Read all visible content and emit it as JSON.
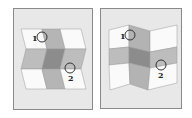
{
  "figure": {
    "panels": [
      {
        "name": "left-panel",
        "description": "zig-zag folded sheet with horizontal and vertical gray bands",
        "markers": [
          {
            "label": "1",
            "label_x": 34,
            "label_y": 41,
            "cx": 42,
            "cy": 37
          },
          {
            "label": "2",
            "label_x": 69,
            "label_y": 81,
            "cx": 70,
            "cy": 68
          }
        ]
      },
      {
        "name": "right-panel",
        "description": "accordion folded sheet with horizontal and vertical gray bands",
        "markers": [
          {
            "label": "1",
            "label_x": 121,
            "label_y": 39,
            "cx": 130,
            "cy": 35
          },
          {
            "label": "2",
            "label_x": 159,
            "label_y": 78,
            "cx": 161,
            "cy": 65
          }
        ]
      }
    ],
    "colors": {
      "frame_bg": "#e8e8e8",
      "frame_border": "#8a8a8a",
      "white": "#fafafa",
      "light_gray": "#bdbdbd",
      "mid_gray": "#a9a9a9",
      "dark_gray": "#8c8c8c",
      "edge": "#777777"
    }
  }
}
